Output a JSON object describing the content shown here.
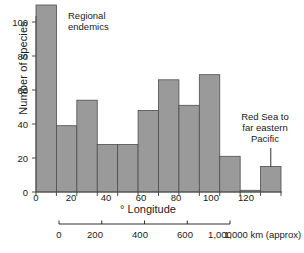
{
  "chart_data": {
    "type": "bar",
    "title": "",
    "subtitle": "",
    "xlabel": "° Longitude",
    "ylabel": "Number of species",
    "xlim": [
      0,
      120
    ],
    "ylim": [
      0,
      112
    ],
    "grid": false,
    "legend": null,
    "bin_width": 10,
    "categories": [
      "0–10",
      "10–20",
      "20–30",
      "30–40",
      "40–50",
      "50–60",
      "60–70",
      "70–80",
      "80–90",
      "90–100",
      "100–110",
      "110–120"
    ],
    "bin_starts": [
      0,
      10,
      20,
      30,
      40,
      50,
      60,
      70,
      80,
      90,
      100,
      110
    ],
    "values": [
      110,
      39,
      54,
      28,
      28,
      48,
      66,
      51,
      69,
      21,
      1,
      15
    ],
    "xticks": [
      0,
      10,
      20,
      30,
      40,
      50,
      60,
      70,
      80,
      90,
      100,
      110,
      120
    ],
    "xtick_labels": [
      "0",
      "",
      "20",
      "",
      "40",
      "",
      "60",
      "",
      "80",
      "",
      "100",
      "",
      "120"
    ],
    "yticks": [
      0,
      20,
      40,
      60,
      80,
      100
    ],
    "ytick_labels": [
      "0",
      "20",
      "40",
      "60",
      "80",
      "100"
    ],
    "bar_color": "#9a9a9a",
    "bar_edge_color": "#4d4d4d",
    "axis_color": "#4d4d4d",
    "text_color": "#1a1a1a",
    "annotations": [
      {
        "name": "regional-endemics",
        "text": "Regional\nendemics",
        "points_to_bin": "0–10"
      },
      {
        "name": "red-sea-to-far-eastern-pacific",
        "text": "Red Sea  to\nfar eastern\nPacific",
        "points_to_bin": "110–120"
      }
    ],
    "secondary_axis": {
      "name": "distance-scale",
      "unit_label": "1,000 km (approx)",
      "tick_labels": [
        "0",
        "200",
        "400",
        "600",
        "1,000"
      ],
      "tick_values": [
        0,
        200,
        400,
        600,
        1000
      ]
    }
  }
}
